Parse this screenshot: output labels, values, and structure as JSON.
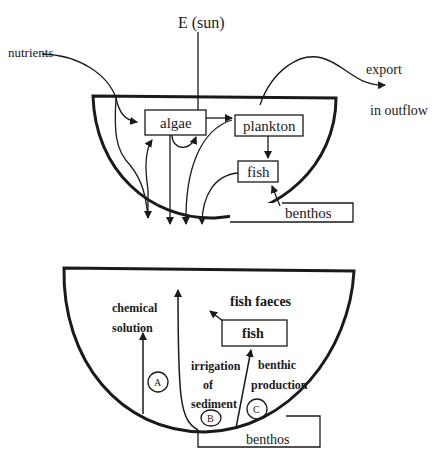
{
  "top_diagram": {
    "sun_label": "E (sun)",
    "nutrients_label": "nutrients",
    "export_label": "export",
    "outflow_label": "in outflow",
    "boxes": {
      "algae": "algae",
      "plankton": "plankton",
      "fish": "fish",
      "benthos": "benthos"
    }
  },
  "bottom_diagram": {
    "chemical_label_line1": "chemical",
    "chemical_label_line2": "solution",
    "fish_faeces_label": "fish faeces",
    "fish_box": "fish",
    "irrigation_line1": "irrigation",
    "irrigation_line2": "of",
    "irrigation_line3": "sediment",
    "benthic_line1": "benthic",
    "benthic_line2": "production",
    "benthos_box": "benthos",
    "markers": [
      "A",
      "B",
      "C"
    ]
  },
  "colors": {
    "ink": "#1a1a1a",
    "background": "#ffffff"
  }
}
